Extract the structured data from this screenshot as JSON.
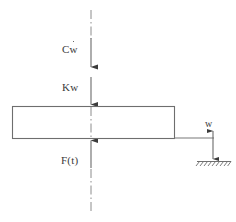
{
  "diagram": {
    "type": "engineering-free-body-diagram",
    "background_color": "#ffffff",
    "line_color": "#595959",
    "text_color": "#3a3a3a",
    "labels": {
      "damping_force": "Cw",
      "damping_force_base": "C",
      "damping_force_variable": "w",
      "damping_force_has_dot": true,
      "spring_force": "Kw",
      "excitation_force": "F(t)",
      "displacement": "w"
    },
    "elements": {
      "mass_block": {
        "name": "mass-block",
        "x": 12,
        "y": 106,
        "width": 163,
        "height": 33
      },
      "centerline": {
        "name": "centerline",
        "x": 91,
        "y_top": 10,
        "y_bottom": 212,
        "style": "dash-dot"
      },
      "damping_arrow": {
        "name": "damping-force-arrow",
        "direction": "down",
        "x": 91,
        "y_start": 40,
        "y_end": 68
      },
      "spring_arrow": {
        "name": "spring-force-arrow",
        "direction": "down",
        "x": 91,
        "y_start": 78,
        "y_end": 105
      },
      "excitation_arrow": {
        "name": "excitation-force-arrow",
        "direction": "up",
        "x": 91,
        "y_start": 168,
        "y_end": 139
      },
      "reference_line": {
        "name": "reference-line",
        "x_start": 175,
        "x_end": 213,
        "y": 138
      },
      "displacement_arrow": {
        "name": "displacement-dimension-arrow",
        "direction": "double",
        "x": 213,
        "y_top": 130,
        "y_bottom": 161
      },
      "ground": {
        "name": "ground-support",
        "x_start": 197,
        "x_end": 231,
        "y": 161,
        "hatch_count": 8
      }
    }
  }
}
